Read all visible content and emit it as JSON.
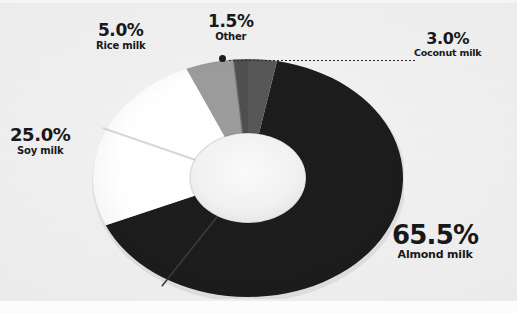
{
  "background": {
    "paper_color": "#ededed",
    "strip_color": "#fcfcfc"
  },
  "chart_data": {
    "type": "pie",
    "variant": "donut",
    "title": "",
    "subtitle": "",
    "xlabel": "",
    "ylabel": "",
    "legend_position": "none",
    "labels_on_slices": false,
    "leader_lines": [
      {
        "for": "Coconut milk",
        "from_slice_edge": true,
        "style": "dotted"
      }
    ],
    "start_angle_deg": 0,
    "direction": "clockwise",
    "categories": [
      "Coconut milk",
      "Almond milk",
      "Soy milk",
      "Rice milk",
      "Other"
    ],
    "values": [
      3.0,
      65.5,
      25.0,
      5.0,
      1.5
    ],
    "units": "%",
    "colors": [
      "#565656",
      "#1b1b1b",
      "#ffffff",
      "#9b9b9b",
      "#4e4e4e"
    ],
    "slices": [
      {
        "name": "Coconut milk",
        "value": 3.0,
        "value_label": "3.0%",
        "color": "#565656"
      },
      {
        "name": "Almond milk",
        "value": 65.5,
        "value_label": "65.5%",
        "color": "#1b1b1b"
      },
      {
        "name": "Soy milk",
        "value": 25.0,
        "value_label": "25.0%",
        "color": "#ffffff"
      },
      {
        "name": "Rice milk",
        "value": 5.0,
        "value_label": "5.0%",
        "color": "#9b9b9b"
      },
      {
        "name": "Other",
        "value": 1.5,
        "value_label": "1.5%",
        "color": "#4e4e4e"
      }
    ]
  },
  "labels": {
    "rice": {
      "pct": "5.0%",
      "name": "Rice milk"
    },
    "other": {
      "pct": "1.5%",
      "name": "Other"
    },
    "coconut": {
      "pct": "3.0%",
      "name": "Coconut milk"
    },
    "soy": {
      "pct": "25.0%",
      "name": "Soy milk"
    },
    "almond": {
      "pct": "65.5%",
      "name": "Almond milk"
    }
  }
}
